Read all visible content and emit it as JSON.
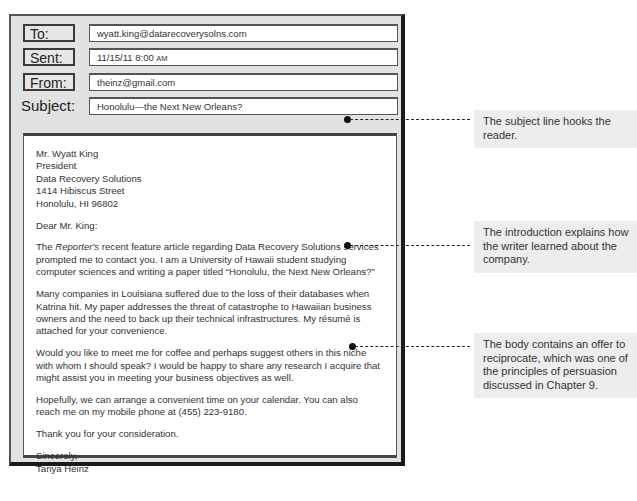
{
  "email": {
    "header": {
      "to_label": "To:",
      "to_value": "wyatt.king@datarecoverysolns.com",
      "sent_label": "Sent:",
      "sent_date": "11/15/11  8:00",
      "sent_ampm": "AM",
      "from_label": "From:",
      "from_value": "theinz@gmail.com",
      "subject_label": "Subject:",
      "subject_value": "Honolulu—the Next New Orleans?"
    },
    "body": {
      "address": [
        "Mr. Wyatt King",
        "President",
        "Data Recovery Solutions",
        "1414 Hibiscus Street",
        "Honolulu, HI  96802"
      ],
      "salutation": "Dear Mr. King:",
      "intro_italic": "Reporter's",
      "intro_prefix": "The ",
      "intro_rest": " recent feature article regarding Data Recovery Solutions services prompted me to contact you. I am a University of Hawaii student studying computer sciences and writing a paper titled “Honolulu, the Next New Orleans?”",
      "paragraph2": "Many companies in Louisiana suffered due to the loss of their databases when Katrina hit. My paper addresses the threat of catastrophe to Hawaiian business owners and the need to back up their technical infrastructures. My résumé is attached for your convenience.",
      "paragraph3": "Would you like to meet me for coffee and perhaps suggest others in this niche with whom I should speak? I would be happy to share any research I acquire that might assist you in meeting your business objectives as well.",
      "paragraph4": "Hopefully, we can arrange a convenient time on your calendar. You can also reach me on my mobile phone at (455) 223-9180.",
      "paragraph5": "Thank you for your consideration.",
      "closing": "Sincerely,",
      "signature": "Tanya Heinz"
    }
  },
  "annotations": [
    {
      "text": "The subject line hooks the reader."
    },
    {
      "text": "The introduction explains how the writer learned about the company."
    },
    {
      "text": "The body contains an offer to reciprocate, which was one of the principles of persuasion discussed in Chapter 9."
    }
  ],
  "colors": {
    "frame": "#e2e2e2",
    "frame_border": "#1a1a1a",
    "note_bg": "#ededed",
    "connector": "#222222"
  }
}
